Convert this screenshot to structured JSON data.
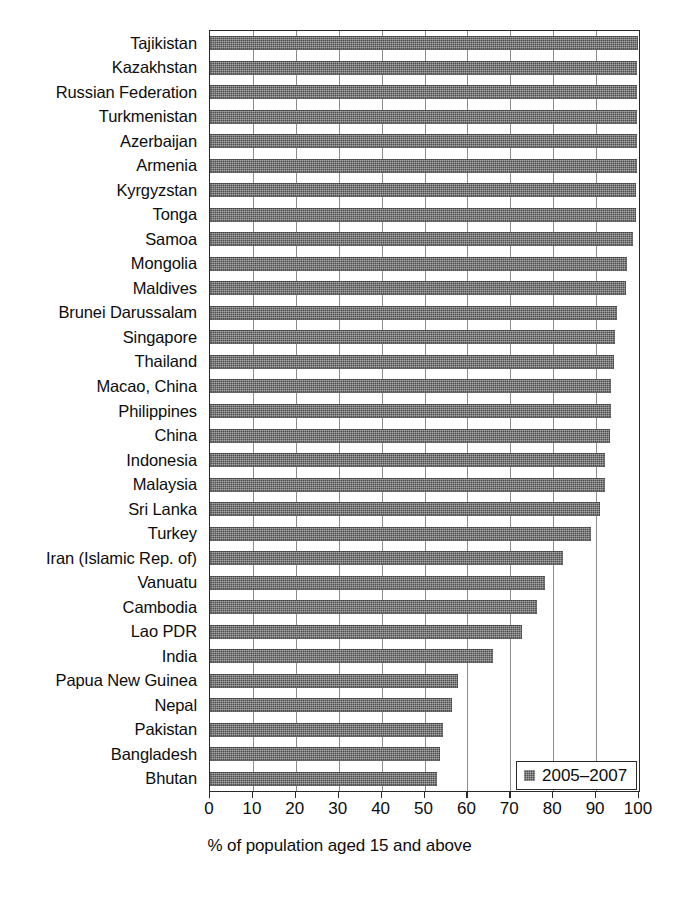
{
  "chart_data": {
    "type": "bar",
    "orientation": "horizontal",
    "title": "",
    "subtitle": "",
    "xlabel": "% of population aged 15 and above",
    "ylabel": "",
    "xlim": [
      0,
      100
    ],
    "xticks": [
      0,
      10,
      20,
      30,
      40,
      50,
      60,
      70,
      80,
      90,
      100
    ],
    "xtick_labels": [
      "0",
      "10",
      "20",
      "30",
      "40",
      "50",
      "60",
      "70",
      "80",
      "90",
      "100"
    ],
    "grid": "vertical",
    "legend_position": "bottom-right",
    "legend": [
      "2005–2007"
    ],
    "bar_color": "#4d4d4d",
    "categories": [
      "Tajikistan",
      "Kazakhstan",
      "Russian Federation",
      "Turkmenistan",
      "Azerbaijan",
      "Armenia",
      "Kyrgyzstan",
      "Tonga",
      "Samoa",
      "Mongolia",
      "Maldives",
      "Brunei Darussalam",
      "Singapore",
      "Thailand",
      "Macao, China",
      "Philippines",
      "China",
      "Indonesia",
      "Malaysia",
      "Sri Lanka",
      "Turkey",
      "Iran (Islamic Rep. of)",
      "Vanuatu",
      "Cambodia",
      "Lao PDR",
      "India",
      "Papua New Guinea",
      "Nepal",
      "Pakistan",
      "Bangladesh",
      "Bhutan"
    ],
    "series": [
      {
        "name": "2005–2007",
        "values": [
          99.7,
          99.6,
          99.5,
          99.5,
          99.5,
          99.5,
          99.2,
          99.2,
          98.7,
          97.3,
          97.0,
          94.9,
          94.4,
          94.1,
          93.5,
          93.4,
          93.3,
          92.0,
          92.1,
          90.8,
          88.7,
          82.3,
          78.1,
          76.3,
          72.7,
          66.0,
          57.8,
          56.5,
          54.2,
          53.5,
          52.8
        ]
      }
    ]
  },
  "legend": {
    "entry_label": "2005–2007",
    "swatch_icon": "legend-swatch-icon"
  },
  "axis": {
    "x_title": "% of population aged 15 and above"
  }
}
